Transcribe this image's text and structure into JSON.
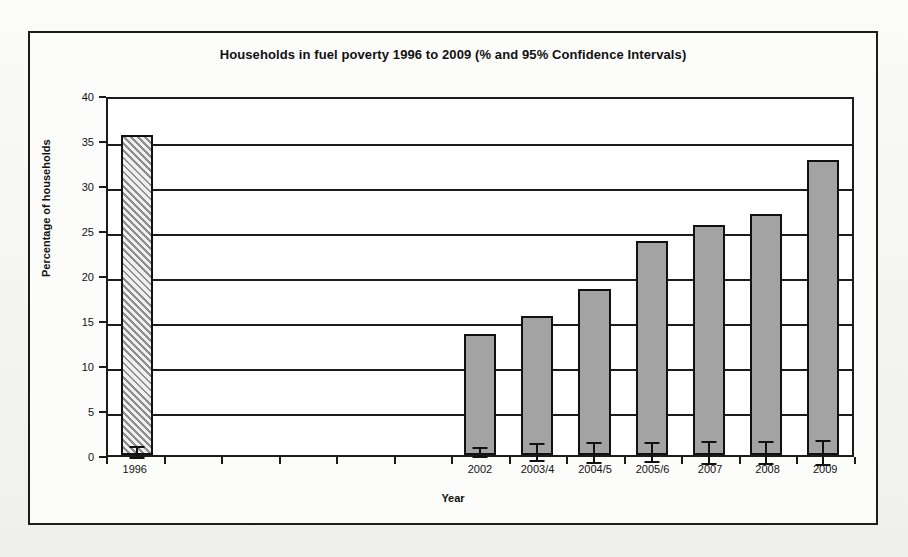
{
  "chart_data": {
    "type": "bar",
    "title": "Households in fuel poverty 1996 to 2009 (% and 95% Confidence Intervals)",
    "xlabel": "Year",
    "ylabel": "Percentage of households",
    "ylim": [
      0,
      40
    ],
    "ytick_values": [
      0,
      5,
      10,
      15,
      20,
      25,
      30,
      35,
      40
    ],
    "ytick_labels": [
      "0",
      "5",
      "10",
      "15",
      "20",
      "25",
      "30",
      "35",
      "40"
    ],
    "grid": true,
    "legend": "none",
    "bar_fill_solid": "#a3a3a3",
    "bar_fill_hatched": "#efefef",
    "bar_edge_color": "#111111",
    "categories": [
      "1996",
      "",
      "",
      "",
      "",
      "",
      "2002",
      "2003/4",
      "2004/5",
      "2005/6",
      "2007",
      "2008",
      "2009"
    ],
    "values": [
      35.6,
      null,
      null,
      null,
      null,
      null,
      13.4,
      15.4,
      18.4,
      23.8,
      25.6,
      26.8,
      32.8
    ],
    "error_low": [
      34.9,
      null,
      null,
      null,
      null,
      null,
      12.8,
      14.4,
      17.2,
      22.7,
      24.3,
      25.5,
      31.4
    ],
    "error_high": [
      36.4,
      null,
      null,
      null,
      null,
      null,
      14.1,
      16.5,
      19.6,
      25.0,
      26.9,
      28.1,
      34.2
    ],
    "styles": [
      "hatched",
      null,
      null,
      null,
      null,
      null,
      "solid",
      "solid",
      "solid",
      "solid",
      "solid",
      "solid",
      "solid"
    ],
    "bars": [
      {
        "category": "1996",
        "value": 35.6,
        "low": 34.9,
        "high": 36.4,
        "style": "hatched"
      },
      {
        "category": "",
        "value": null,
        "low": null,
        "high": null,
        "style": "empty"
      },
      {
        "category": "",
        "value": null,
        "low": null,
        "high": null,
        "style": "empty"
      },
      {
        "category": "",
        "value": null,
        "low": null,
        "high": null,
        "style": "empty"
      },
      {
        "category": "",
        "value": null,
        "low": null,
        "high": null,
        "style": "empty"
      },
      {
        "category": "",
        "value": null,
        "low": null,
        "high": null,
        "style": "empty"
      },
      {
        "category": "2002",
        "value": 13.4,
        "low": 12.8,
        "high": 14.1,
        "style": "solid"
      },
      {
        "category": "2003/4",
        "value": 15.4,
        "low": 14.4,
        "high": 16.5,
        "style": "solid"
      },
      {
        "category": "2004/5",
        "value": 18.4,
        "low": 17.2,
        "high": 19.6,
        "style": "solid"
      },
      {
        "category": "2005/6",
        "value": 23.8,
        "low": 22.7,
        "high": 25.0,
        "style": "solid"
      },
      {
        "category": "2007",
        "value": 25.6,
        "low": 24.3,
        "high": 26.9,
        "style": "solid"
      },
      {
        "category": "2008",
        "value": 26.8,
        "low": 25.5,
        "high": 28.1,
        "style": "solid"
      },
      {
        "category": "2009",
        "value": 32.8,
        "low": 31.4,
        "high": 34.2,
        "style": "solid"
      }
    ]
  }
}
